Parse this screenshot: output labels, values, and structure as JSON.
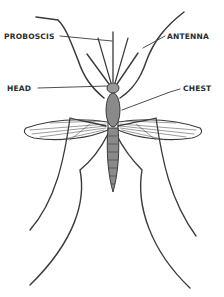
{
  "figure": {
    "labels": {
      "proboscis": "PROBOSCIS",
      "antenna": "ANTENNA",
      "head": "HEAD",
      "chest": "CHEST"
    },
    "colors": {
      "ink": "#3a3a3a",
      "background": "#ffffff",
      "body_fill": "#8a8a8a"
    }
  }
}
